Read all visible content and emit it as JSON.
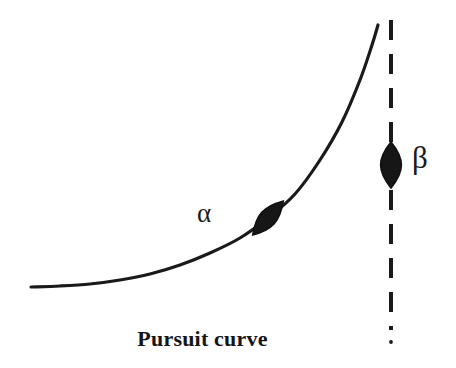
{
  "figure": {
    "caption": "Pursuit curve",
    "background_color": "#ffffff",
    "ink_color": "#1a1a1a",
    "width": 456,
    "height": 368
  },
  "labels": {
    "pursuer": "α",
    "target": "β"
  },
  "icons": {
    "pursuer_marker": "ship-marker-icon",
    "target_marker": "ship-marker-icon",
    "pursuit_path": "curved-path-icon",
    "target_path": "dashed-vertical-line-icon"
  },
  "chart_data": {
    "type": "line",
    "title": "Pursuit curve",
    "xlabel": "",
    "ylabel": "",
    "grid": false,
    "legend": "none",
    "axes_visible": false,
    "xlim": [
      0,
      456
    ],
    "ylim": [
      368,
      0
    ],
    "series": [
      {
        "name": "α",
        "label": "α",
        "style": "solid",
        "color": "#1a1a1a",
        "linewidth": 3.2,
        "description": "Pursuit curve of pursuer alpha, asymptotically approaching the target's straight-line track",
        "points": [
          [
            31,
            287
          ],
          [
            60,
            286
          ],
          [
            90,
            284
          ],
          [
            120,
            280
          ],
          [
            150,
            274
          ],
          [
            180,
            265
          ],
          [
            210,
            253
          ],
          [
            240,
            238
          ],
          [
            268,
            218
          ],
          [
            295,
            194
          ],
          [
            320,
            160
          ],
          [
            342,
            122
          ],
          [
            360,
            80
          ],
          [
            372,
            45
          ],
          [
            378,
            25
          ]
        ],
        "marker": {
          "name": "α",
          "shape": "lens",
          "x": 268,
          "y": 218,
          "rotation_deg": 42,
          "length": 46,
          "width": 17,
          "color": "#161616"
        }
      },
      {
        "name": "β",
        "label": "β",
        "style": "dashed",
        "color": "#1a1a1a",
        "linewidth": 4.0,
        "dash_length": 20,
        "dash_gap": 14,
        "description": "Straight vertical track of target beta",
        "points": [
          [
            391,
            20
          ],
          [
            391,
            342
          ]
        ],
        "marker": {
          "name": "β",
          "shape": "lens",
          "x": 391,
          "y": 165,
          "rotation_deg": 0,
          "length": 46,
          "width": 20,
          "color": "#161616"
        }
      }
    ],
    "annotations": [
      {
        "text": "α",
        "x": 207,
        "y": 217
      },
      {
        "text": "β",
        "x": 421,
        "y": 165
      },
      {
        "text": "Pursuit curve",
        "x": 202,
        "y": 345
      }
    ]
  }
}
